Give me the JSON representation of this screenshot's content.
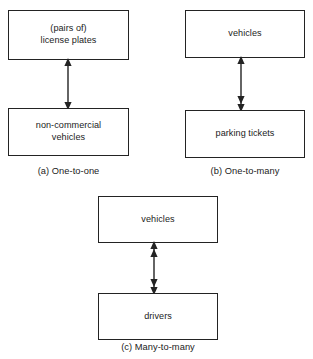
{
  "diagram": {
    "kind": "entity-relationship-cardinality",
    "stroke_color": "#232323",
    "text_color": "#1b1b1b",
    "background_color": "#ffffff",
    "panels": [
      {
        "id": "a",
        "caption": "(a) One-to-one",
        "top_entity": "(pairs of)\nlicense plates",
        "bottom_entity": "non-commercial\nvehicles",
        "connector": {
          "top_arrowheads": 1,
          "bottom_arrowheads": 1,
          "orientation": "vertical",
          "style": "double-headed"
        }
      },
      {
        "id": "b",
        "caption": "(b) One-to-many",
        "top_entity": "vehicles",
        "bottom_entity": "parking tickets",
        "connector": {
          "top_arrowheads": 1,
          "bottom_arrowheads": 2,
          "orientation": "vertical",
          "style": "double-headed"
        }
      },
      {
        "id": "c",
        "caption": "(c) Many-to-many",
        "top_entity": "vehicles",
        "bottom_entity": "drivers",
        "connector": {
          "top_arrowheads": 2,
          "bottom_arrowheads": 2,
          "orientation": "vertical",
          "style": "double-headed"
        }
      }
    ]
  }
}
